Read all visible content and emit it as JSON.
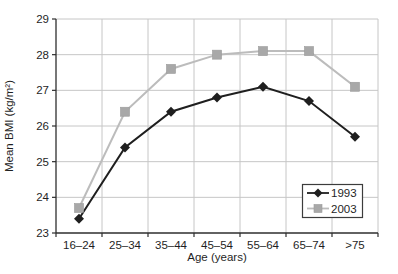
{
  "chart_data": {
    "type": "line",
    "title": "",
    "xlabel": "Age (years)",
    "ylabel": "Mean BMI (kg/m²)",
    "categories": [
      "16–24",
      "25–34",
      "35–44",
      "45–54",
      "55–64",
      "65–74",
      ">75"
    ],
    "ylim": [
      23,
      29
    ],
    "ytick_step": 1,
    "grid": true,
    "legend_position": "lower-right",
    "series": [
      {
        "name": "1993",
        "marker": "diamond",
        "line_color": "#1f1f1f",
        "marker_color": "#1f1f1f",
        "values": [
          23.4,
          25.4,
          26.4,
          26.8,
          27.1,
          26.7,
          25.7
        ]
      },
      {
        "name": "2003",
        "marker": "square",
        "line_color": "#bcbcbc",
        "marker_color": "#a8a8a8",
        "values": [
          23.7,
          26.4,
          27.6,
          28.0,
          28.1,
          28.1,
          27.1
        ]
      }
    ],
    "colors": {
      "grid": "#c6c6c6",
      "axis": "#2e2e2e",
      "text": "#1f1f1f",
      "legend_border": "#3c3c3c",
      "background": "#ffffff"
    }
  }
}
